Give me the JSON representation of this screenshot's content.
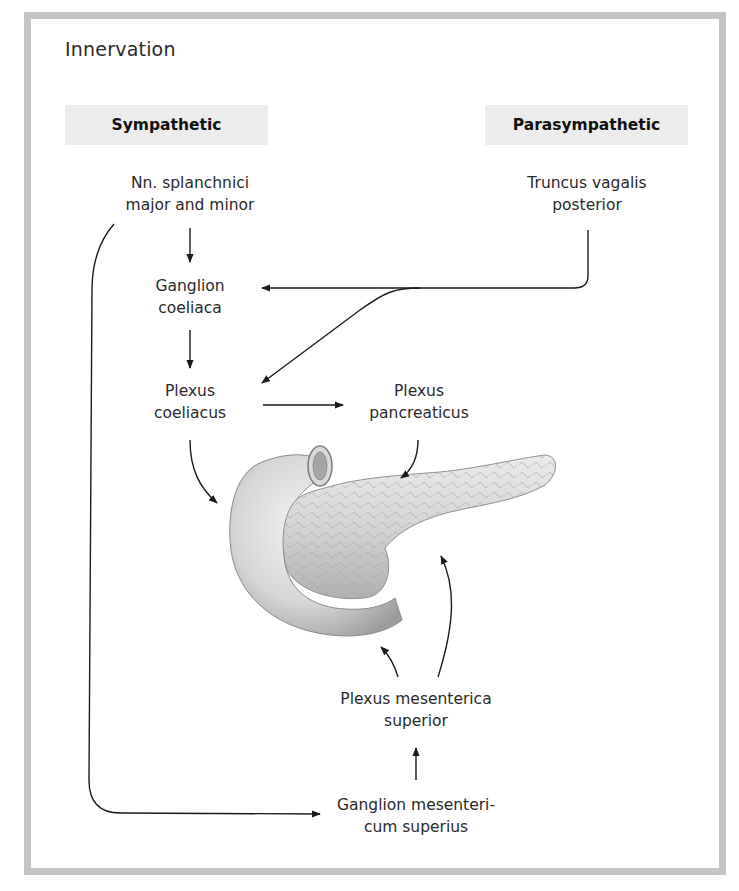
{
  "figure": {
    "title": "Innervation",
    "headers": {
      "sympathetic": "Sympathetic",
      "parasympathetic": "Parasympathetic"
    },
    "nodes": {
      "splanchnici": [
        "Nn. splanchnici",
        "major and minor"
      ],
      "truncus_vagalis": [
        "Truncus vagalis",
        "posterior"
      ],
      "ganglion_coeliaca": [
        "Ganglion",
        "coeliaca"
      ],
      "plexus_coeliacus": [
        "Plexus",
        "coeliacus"
      ],
      "plexus_pancreaticus": [
        "Plexus",
        "pancreaticus"
      ],
      "plexus_mesenterica": [
        "Plexus mesenterica",
        "superior"
      ],
      "ganglion_mesentericum": [
        "Ganglion mesenteri-",
        "cum superius"
      ]
    },
    "illustration": "pancreas-with-duodenum",
    "colors": {
      "frame": "#c4c4c4",
      "header_bg": "#ececec",
      "arrow": "#1a1a1a",
      "text": "#2a2a2a"
    }
  }
}
